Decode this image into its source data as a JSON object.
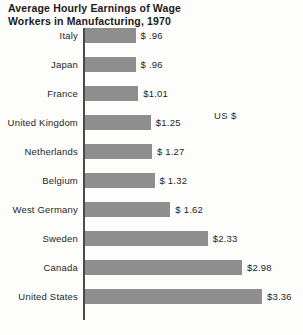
{
  "chart_data": {
    "type": "bar",
    "orientation": "horizontal",
    "title": "Average Hourly Earnings of Wage\nWorkers in Manufacturing, 1970",
    "xlabel": "",
    "ylabel": "",
    "unit_note": "US $",
    "grid": false,
    "legend": "none",
    "xlim": [
      0,
      3.36
    ],
    "categories": [
      "Italy",
      "Japan",
      "France",
      "United Kingdom",
      "Netherlands",
      "Belgium",
      "West Germany",
      "Sweden",
      "Canada",
      "United States"
    ],
    "values": [
      0.96,
      0.96,
      1.01,
      1.25,
      1.27,
      1.32,
      1.62,
      2.33,
      2.98,
      3.36
    ],
    "value_labels": [
      "$ .96",
      "$ .96",
      "$1.01",
      "$1.25",
      "$ 1.27",
      "$ 1.32",
      "$ 1.62",
      "$2.33",
      "$2.98",
      "$3.36"
    ],
    "bar_color": "#8e8e8e",
    "text_color": "#1f1f1f",
    "background_color": "#fdfdfc"
  }
}
